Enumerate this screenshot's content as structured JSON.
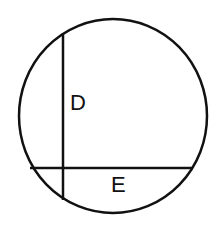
{
  "diagram": {
    "type": "circle-with-chords",
    "colors": {
      "stroke": "#111111",
      "background": "#ffffff",
      "text": "#111111"
    },
    "circle": {
      "cx": 113,
      "cy": 116,
      "rx": 94,
      "ry": 97,
      "stroke_width": 2.5
    },
    "chords": [
      {
        "id": "vertical-chord",
        "x1": 63,
        "y1": 33,
        "x2": 63,
        "y2": 200,
        "stroke_width": 2.5
      },
      {
        "id": "horizontal-chord",
        "x1": 30,
        "y1": 168,
        "x2": 193,
        "y2": 168,
        "stroke_width": 2.5
      }
    ],
    "labels": [
      {
        "id": "label-d",
        "text": "D",
        "x": 70,
        "y": 110
      },
      {
        "id": "label-e",
        "text": "E",
        "x": 111,
        "y": 192
      }
    ]
  }
}
